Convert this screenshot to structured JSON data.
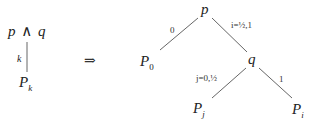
{
  "left": {
    "top_label": {
      "a": "p",
      "op": "∧",
      "b": "q"
    },
    "edge_label": "k",
    "bottom_label": {
      "base": "P",
      "sub": "k"
    }
  },
  "implies_symbol": "⇒",
  "tree": {
    "root": {
      "label": "p"
    },
    "left_leaf": {
      "base": "P",
      "sub": "0",
      "edge_label": "0"
    },
    "internal": {
      "label": "q",
      "edge_label": "i=½,1"
    },
    "q_left_leaf": {
      "base": "P",
      "sub": "j",
      "edge_label": "j=0,½"
    },
    "q_right_leaf": {
      "base": "P",
      "sub": "i",
      "edge_label": "1"
    }
  },
  "colors": {
    "line": "#555555",
    "text": "#222222"
  }
}
